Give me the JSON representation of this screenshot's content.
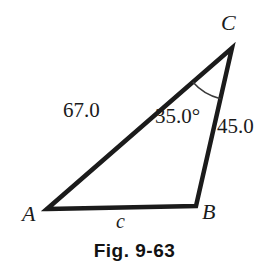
{
  "figure": {
    "caption": "Fig. 9-63",
    "background_color": "#ffffff",
    "stroke_color": "#1b1b1b",
    "text_color": "#1b1b1b"
  },
  "diagram": {
    "type": "triangle",
    "vertices": [
      {
        "name": "A",
        "label": "A",
        "x": 47,
        "y": 209
      },
      {
        "name": "B",
        "label": "B",
        "x": 196,
        "y": 206
      },
      {
        "name": "C",
        "label": "C",
        "x": 232,
        "y": 48
      }
    ],
    "sides": [
      {
        "name": "b",
        "from": "A",
        "to": "C",
        "label": "67.0",
        "known": true
      },
      {
        "name": "a",
        "from": "C",
        "to": "B",
        "label": "45.0",
        "known": true
      },
      {
        "name": "c",
        "from": "A",
        "to": "B",
        "label": "c",
        "known": false
      }
    ],
    "angles": [
      {
        "at": "C",
        "label": "35.0°",
        "value": 35.0,
        "unit": "degrees",
        "arc": true
      }
    ],
    "stroke_width": 4
  },
  "chart_data": {
    "type": "diagram",
    "title": "Fig. 9-63",
    "shape": "triangle",
    "labels": {
      "vertices": [
        "A",
        "B",
        "C"
      ],
      "side_AC": "67.0",
      "side_CB": "45.0",
      "side_AB": "c",
      "angle_C": "35.0°"
    },
    "values": {
      "side_AC": 67.0,
      "side_CB": 45.0,
      "angle_C_deg": 35.0,
      "side_AB": null
    }
  }
}
